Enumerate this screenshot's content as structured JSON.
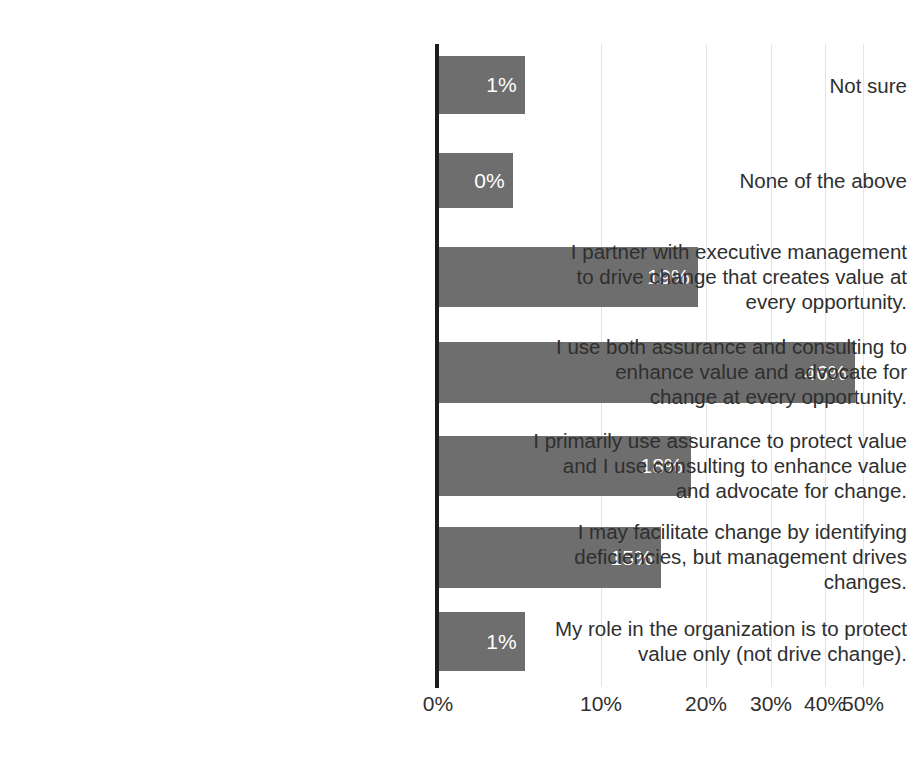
{
  "chart_data": {
    "type": "bar",
    "orientation": "horizontal",
    "title": "",
    "xlabel": "",
    "ylabel": "",
    "xlim": [
      0,
      50
    ],
    "grid": true,
    "legend": null,
    "value_label_format": "percent",
    "bar_color": "#6e6e6e",
    "axis_color": "#1c1c1c",
    "gridline_color": "#e4e4e6",
    "value_label_color": "#ffffff",
    "background_color": "#ffffff",
    "categories": [
      "Not sure",
      "None of the above",
      "I partner with executive management\nto drive change that creates value at\nevery opportunity.",
      "I use both assurance and consulting to\nenhance value and advocate for\nchange at every opportunity.",
      "I primarily use assurance to protect value\nand I use consulting to enhance value\nand advocate for change.",
      "I may facilitate change by identifying\ndeficiencies, but management drives\nchanges.",
      "My role in the organization is to protect\nvalue only (not drive change)."
    ],
    "values": [
      1,
      0,
      19,
      46,
      18,
      15,
      1
    ],
    "value_labels": [
      "1%",
      "0%",
      "19%",
      "46%",
      "18%",
      "15%",
      "1%"
    ],
    "xticks": [
      0,
      10,
      20,
      30,
      40,
      50
    ],
    "xtick_labels": [
      "0%",
      "10%",
      "20%",
      "30%",
      "40%",
      "50%"
    ],
    "xtick_pixel_positions": [
      0,
      163,
      268,
      333,
      387,
      425
    ],
    "bar_pixel_widths": [
      87,
      75,
      260,
      417,
      253,
      223,
      87
    ],
    "bar_geometry": [
      {
        "top": 12,
        "height": 58
      },
      {
        "top": 109,
        "height": 55
      },
      {
        "top": 203,
        "height": 60
      },
      {
        "top": 298,
        "height": 61
      },
      {
        "top": 392,
        "height": 60
      },
      {
        "top": 483,
        "height": 61
      },
      {
        "top": 568,
        "height": 59
      }
    ],
    "label_geometry": [
      {
        "top": 29
      },
      {
        "top": 124
      },
      {
        "top": 195
      },
      {
        "top": 290
      },
      {
        "top": 384
      },
      {
        "top": 475
      },
      {
        "top": 572
      }
    ]
  }
}
